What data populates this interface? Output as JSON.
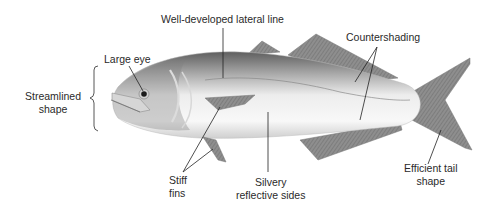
{
  "diagram": {
    "colors": {
      "body_dark": "#6f6f6f",
      "body_light": "#f4f4f4",
      "fin": "#8a8a8a",
      "leader_line": "#222222",
      "text": "#2a2a2a"
    },
    "labels": {
      "lateral_line": "Well-developed lateral line",
      "large_eye": "Large eye",
      "countershading": "Countershading",
      "streamlined_1": "Streamlined",
      "streamlined_2": "shape",
      "stiff_fins_1": "Stiff",
      "stiff_fins_2": "fins",
      "silvery_1": "Silvery",
      "silvery_2": "reflective sides",
      "tail_1": "Efficient tail",
      "tail_2": "shape"
    }
  }
}
